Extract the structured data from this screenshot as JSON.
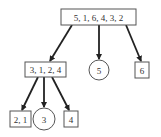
{
  "diagram": {
    "type": "tree",
    "nodes": [
      {
        "id": "root",
        "label": "5, 1, 6, 4, 3, 2",
        "shape": "box"
      },
      {
        "id": "n3124",
        "label": "3, 1, 2, 4",
        "shape": "box"
      },
      {
        "id": "n5",
        "label": "5",
        "shape": "circle"
      },
      {
        "id": "n6",
        "label": "6",
        "shape": "box"
      },
      {
        "id": "n21",
        "label": "2, 1",
        "shape": "box"
      },
      {
        "id": "n3",
        "label": "3",
        "shape": "circle"
      },
      {
        "id": "n4",
        "label": "4",
        "shape": "box"
      }
    ],
    "edges": [
      {
        "from": "root",
        "to": "n3124"
      },
      {
        "from": "root",
        "to": "n5"
      },
      {
        "from": "root",
        "to": "n6"
      },
      {
        "from": "n3124",
        "to": "n21"
      },
      {
        "from": "n3124",
        "to": "n3"
      },
      {
        "from": "n3124",
        "to": "n4"
      }
    ],
    "colors": {
      "stroke": "#333333",
      "edge": "#222222",
      "background": "#ffffff"
    }
  }
}
